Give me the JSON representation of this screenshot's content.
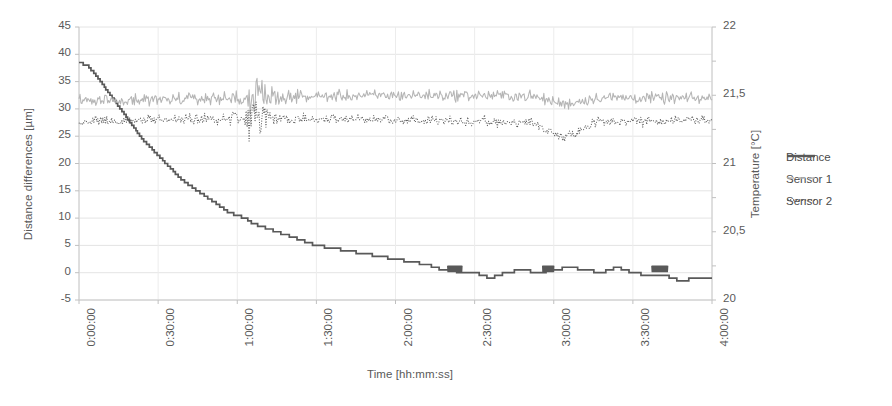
{
  "chart_data": {
    "type": "line",
    "title": "",
    "xlabel": "Time [hh:mm:ss]",
    "ylabel": "Distance differences [µm]",
    "y2label": "Temperature [°C]",
    "xlim": [
      "0:00:00",
      "4:00:00"
    ],
    "ylim": [
      -5,
      45
    ],
    "y2lim": [
      20,
      22
    ],
    "grid": true,
    "legend_position": "right",
    "x_tick_labels": [
      "0:00:00",
      "0:30:00",
      "1:00:00",
      "1:30:00",
      "2:00:00",
      "2:30:00",
      "3:00:00",
      "3:30:00",
      "4:00:00"
    ],
    "y_tick_labels": [
      "45",
      "40",
      "35",
      "30",
      "25",
      "20",
      "15",
      "10",
      "5",
      "0",
      "-5"
    ],
    "y2_tick_labels": [
      "22",
      "21,5",
      "21",
      "20,5",
      "20"
    ],
    "series": [
      {
        "name": "Distance",
        "axis": "left",
        "unit": "µm",
        "style": "solid",
        "color": "#595959",
        "description": "Stepwise exponential decay from 38.5 µm to about -1 µm over 4 hours, quantized into descending staircase steps that lengthen as the curve flattens; after 2:20 it oscillates between +1 and -2 µm.",
        "x_hours": [
          0.0,
          0.05,
          0.1,
          0.15,
          0.2,
          0.25,
          0.3,
          0.35,
          0.4,
          0.45,
          0.5,
          0.55,
          0.6,
          0.65,
          0.7,
          0.75,
          0.8,
          0.85,
          0.9,
          0.95,
          1.0,
          1.05,
          1.1,
          1.15,
          1.2,
          1.25,
          1.3,
          1.35,
          1.4,
          1.45,
          1.5,
          1.6,
          1.7,
          1.8,
          1.9,
          2.0,
          2.1,
          2.2,
          2.3,
          2.4,
          2.5,
          2.6,
          2.7,
          2.8,
          2.9,
          3.0,
          3.1,
          3.2,
          3.3,
          3.4,
          3.5,
          3.6,
          3.7,
          3.8,
          3.9,
          4.0
        ],
        "values": [
          38.5,
          38.0,
          36.5,
          34.5,
          32.5,
          30.5,
          28.5,
          26.5,
          24.5,
          23.0,
          21.5,
          20.0,
          18.5,
          17.0,
          16.0,
          15.0,
          14.0,
          13.0,
          12.0,
          11.0,
          10.5,
          10.0,
          9.0,
          8.5,
          8.0,
          7.5,
          7.0,
          6.5,
          6.0,
          5.5,
          5.0,
          4.5,
          4.0,
          3.5,
          3.0,
          2.5,
          2.0,
          1.5,
          0.5,
          0.2,
          0.0,
          -1.0,
          0.0,
          0.5,
          0.0,
          0.5,
          1.0,
          0.5,
          0.0,
          1.0,
          0.0,
          -0.5,
          -0.5,
          -1.5,
          -1.0,
          -1.0
        ]
      },
      {
        "name": "Sensor 1",
        "axis": "right",
        "unit": "°C",
        "style": "dashed",
        "color": "#b5b5b5",
        "description": "Noisy temperature trace hovering near 21.45-21.55 °C, with a noise burst around 1:10 and a shallow dip near 3:05, then recovering to ~21.5 °C.",
        "baseline": 21.47,
        "noise_amplitude": 0.035
      },
      {
        "name": "Sensor 2",
        "axis": "right",
        "unit": "°C",
        "style": "dotted",
        "color": "#5a5a5a",
        "description": "Noisy temperature trace around 21.25-21.35 °C, heavy scatter burst near 1:05-1:15 and a pronounced dip to ~21.15 °C near 3:05 before settling near 21.32 °C.",
        "baseline": 21.3,
        "noise_amplitude": 0.03
      }
    ]
  },
  "legend": {
    "items": [
      {
        "label": "Distance",
        "style": "solid",
        "color": "#595959"
      },
      {
        "label": "Sensor 1",
        "style": "dashed",
        "color": "#b5b5b5"
      },
      {
        "label": "Sensor 2",
        "style": "dotted",
        "color": "#5a5a5a"
      }
    ]
  }
}
